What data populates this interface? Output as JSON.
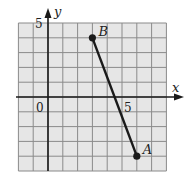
{
  "chart_data": {
    "type": "line",
    "title": "",
    "xlabel": "x",
    "ylabel": "y",
    "xlim": [
      -2,
      8
    ],
    "ylim": [
      -5,
      5
    ],
    "grid": true,
    "tick_labels": {
      "origin": "0",
      "x": "5",
      "y": "5"
    },
    "points": [
      {
        "name": "A",
        "x": 6,
        "y": -4
      },
      {
        "name": "B",
        "x": 3,
        "y": 4
      }
    ],
    "segments": [
      {
        "from": "B",
        "to": "A"
      }
    ]
  },
  "colors": {
    "grid_bg": "#e6e6e6",
    "grid_line": "#8a8a8a",
    "ink": "#1a1a1a"
  }
}
